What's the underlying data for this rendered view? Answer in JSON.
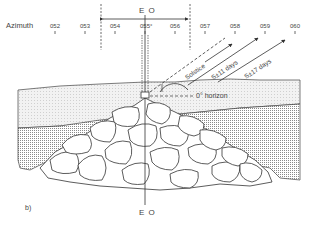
{
  "figure": {
    "panel_label": "b)",
    "axis": {
      "title": "Azimuth",
      "ticks": [
        "052",
        "053",
        "054",
        "055°",
        "056",
        "057",
        "058",
        "059",
        "060"
      ]
    },
    "eo_label_top": "E O",
    "eo_label_bottom": "E O",
    "rays": [
      {
        "label": "Solstice",
        "style": "dashed"
      },
      {
        "label": "S±11 days",
        "style": "solid-arrow"
      },
      {
        "label": "S±17 days",
        "style": "solid-arrow"
      }
    ],
    "horizon_label": "0° horizon",
    "colors": {
      "ink": "#333333",
      "sky_fill": "#efefef",
      "stipple": "#9a9a9a",
      "background": "#ffffff"
    }
  }
}
